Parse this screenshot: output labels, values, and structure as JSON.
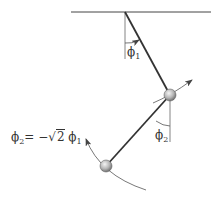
{
  "diagram": {
    "labels": {
      "phi1": "ϕ",
      "phi1_sub": "1",
      "phi2": "ϕ",
      "phi2_sub": "2"
    },
    "equation": {
      "lhs": "ϕ",
      "lhs_sub": "2",
      "eq": "= −",
      "root_sign": "√",
      "radicand": "2",
      "rhs": "ϕ",
      "rhs_sub": "1"
    },
    "colors": {
      "line": "#333333",
      "bob": "#b0b0b0",
      "thin": "#555555"
    }
  }
}
